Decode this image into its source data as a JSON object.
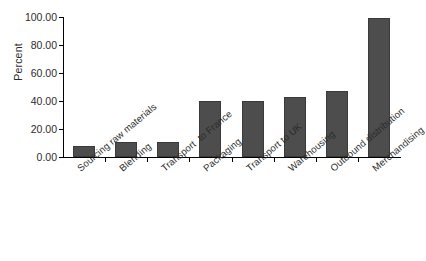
{
  "chart_data": {
    "type": "bar",
    "title": "",
    "xlabel": "",
    "ylabel": "Percent",
    "ylim": [
      0,
      100
    ],
    "yticks": [
      0,
      20,
      40,
      60,
      80,
      100
    ],
    "ytick_labels": [
      "0.00",
      "20.00",
      "40.00",
      "60.00",
      "80.00",
      "100.00"
    ],
    "grid": false,
    "legend": "none",
    "bar_color": "#4d4d4d",
    "bar_edge_color": "#3a3a3a",
    "categories": [
      "Sourcing raw materials",
      "Blending",
      "Transport  to France",
      "Packaging",
      "Transport to UK",
      "Warehousing",
      "Outbound distribution",
      "Merchandising"
    ],
    "values": [
      8,
      10.5,
      10.5,
      40,
      40,
      43,
      47,
      99.5
    ]
  }
}
